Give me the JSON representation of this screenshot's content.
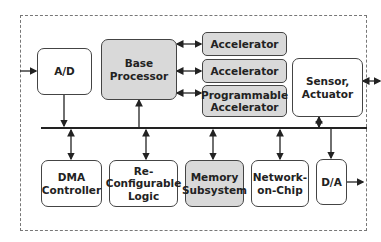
{
  "diagram": {
    "blocks": {
      "ad": "A/D",
      "base_processor_1": "Base",
      "base_processor_2": "Processor",
      "accelerator_1": "Accelerator",
      "accelerator_2": "Accelerator",
      "prog_acc_1": "Programmable",
      "prog_acc_2": "Accelerator",
      "sensor_1": "Sensor,",
      "sensor_2": "Actuator",
      "dma_1": "DMA",
      "dma_2": "Controller",
      "reconf_1": "Re-",
      "reconf_2": "Configurable",
      "reconf_3": "Logic",
      "memory_1": "Memory",
      "memory_2": "Subsystem",
      "noc_1": "Network-",
      "noc_2": "on-Chip",
      "da": "D/A"
    },
    "colors": {
      "shaded": "#d9d9d9",
      "line": "#222222"
    }
  }
}
